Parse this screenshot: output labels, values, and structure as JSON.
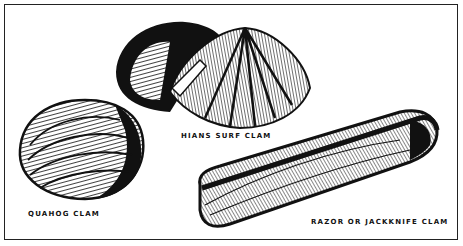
{
  "figure": {
    "labels": {
      "surf_clam": "HIANS SURF CLAM",
      "quahog": "QUAHOG CLAM",
      "razor": "RAZOR OR JACKKNIFE CLAM"
    },
    "colors": {
      "ink": "#111111",
      "paper": "#ffffff",
      "border": "#222222"
    }
  }
}
